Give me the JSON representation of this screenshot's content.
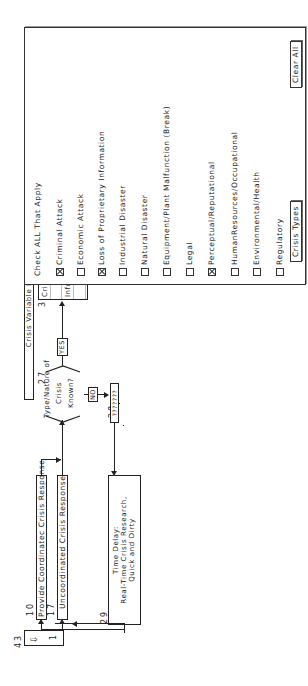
{
  "diagram": {
    "title_bar": "Crisis Variable I: TYPES",
    "nodes": {
      "n10": {
        "id": "10",
        "label": "Provide Coordinatec Crisis Response"
      },
      "n17": {
        "id": "17",
        "label": "Uncoordinated Crisis Response"
      },
      "n27": {
        "id": "27",
        "label_line1": "Type/Nature of",
        "label_line2": "Crisis",
        "label_line3": "Known?"
      },
      "n28": {
        "id": "28",
        "label": "???????"
      },
      "n29": {
        "id": "29",
        "label_line1": "Time Delay:",
        "label_line2": "Real-Time Crisis Research,",
        "label_line3": "Quick and Dirty"
      },
      "n30": {
        "id": "30"
      },
      "n43": {
        "id": "43"
      }
    },
    "branches": {
      "yes": "YES",
      "no": "NO"
    },
    "stepper": {
      "value": "1",
      "icon": "down-arrow-icon"
    },
    "listbox": {
      "rows": [
        "Criminal Attack",
        "",
        "Information Loss",
        ""
      ],
      "scroll_up": "⇧",
      "scroll_down": "⇩",
      "thumb": "≡"
    }
  },
  "panel": {
    "heading": "Check ALL That Apply",
    "options": [
      {
        "label": "Criminal Attack",
        "checked": true
      },
      {
        "label": "Economic Attack",
        "checked": false
      },
      {
        "label": "Loss of Proprietary Information",
        "checked": true
      },
      {
        "label": "Industrial Disaster",
        "checked": false
      },
      {
        "label": "Natural Disaster",
        "checked": false
      },
      {
        "label": "Equipment/Plant Malfunction (Break)",
        "checked": false
      },
      {
        "label": "Legal",
        "checked": false
      },
      {
        "label": "Perceptual/Reputational",
        "checked": true
      },
      {
        "label": "HumanResources/Occupational",
        "checked": false
      },
      {
        "label": "Environmental/Health",
        "checked": false
      },
      {
        "label": "Regulatory",
        "checked": false
      }
    ],
    "buttons": {
      "crisis_types": "Crisis Types",
      "clear_all": "Clear All"
    }
  }
}
